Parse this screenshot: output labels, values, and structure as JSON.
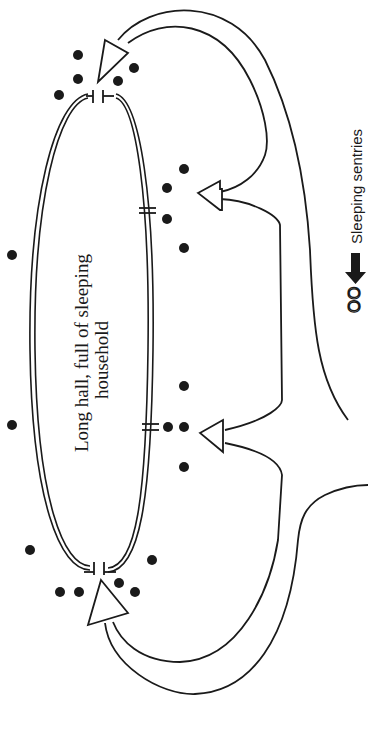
{
  "diagram": {
    "hall": {
      "label_line1": "Long hall, full of sleeping",
      "label_line2": "household"
    },
    "legend": {
      "symbol": "OO",
      "label": "Sleeping sentries"
    },
    "colors": {
      "ink": "#1a1a1a",
      "background": "#ffffff"
    },
    "elements": {
      "doors": [
        "top-door",
        "side-door-upper",
        "side-door-lower",
        "bottom-door"
      ],
      "arrows": [
        "arrow-to-top-door",
        "arrow-to-upper-side-door",
        "arrow-to-lower-side-door",
        "arrow-to-bottom-door"
      ]
    }
  }
}
